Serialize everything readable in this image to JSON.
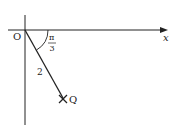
{
  "diagram": {
    "origin_label": "O",
    "x_axis_label": "x",
    "angle_label": {
      "numerator": "π",
      "denominator": "3"
    },
    "segment_length_label": "2",
    "point_label": "Q",
    "point_marker": "×"
  },
  "colors": {
    "stroke": "#222222",
    "background": "#ffffff"
  }
}
